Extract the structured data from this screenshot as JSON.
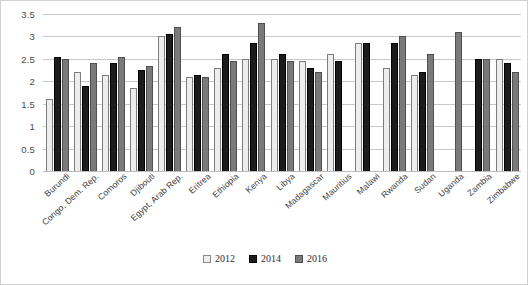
{
  "chart_data": {
    "type": "bar",
    "title": "",
    "subtitle": "",
    "xlabel": "",
    "ylabel": "",
    "ylim": [
      0,
      3.5
    ],
    "yticks": [
      "0",
      "0.5",
      "1",
      "1.5",
      "2",
      "2.5",
      "3",
      "3.5"
    ],
    "grid": true,
    "legend_position": "bottom",
    "categories": [
      "Burundi",
      "Congo, Dem. Rep.",
      "Comoros",
      "Djibouti",
      "Egypt, Arab Rep.",
      "Eritrea",
      "Ethiopia",
      "Kenya",
      "Libya",
      "Madagascar",
      "Mauritius",
      "Malawi",
      "Rwanda",
      "Sudan",
      "Uganda",
      "Zambia",
      "Zimbabwe"
    ],
    "series": [
      {
        "name": "2012",
        "color": "#ededed",
        "values": [
          1.6,
          2.2,
          2.15,
          1.85,
          3.0,
          2.1,
          2.3,
          2.5,
          2.5,
          2.45,
          2.6,
          2.85,
          2.3,
          2.15,
          null,
          null,
          2.5
        ]
      },
      {
        "name": "2014",
        "color": "#1c1c1c",
        "values": [
          2.55,
          1.9,
          2.4,
          2.25,
          3.05,
          2.15,
          2.6,
          2.85,
          2.6,
          2.3,
          2.45,
          2.85,
          2.85,
          2.2,
          null,
          2.5,
          2.4
        ]
      },
      {
        "name": "2016",
        "color": "#7a7a7a",
        "values": [
          2.5,
          2.4,
          2.55,
          2.35,
          3.2,
          2.1,
          2.45,
          3.3,
          2.45,
          2.2,
          null,
          null,
          3.0,
          2.6,
          3.1,
          2.5,
          2.2
        ]
      }
    ]
  },
  "legend": {
    "items": [
      {
        "label": "2012",
        "key": "s2012"
      },
      {
        "label": "2014",
        "key": "s2014"
      },
      {
        "label": "2016",
        "key": "s2016"
      }
    ]
  }
}
